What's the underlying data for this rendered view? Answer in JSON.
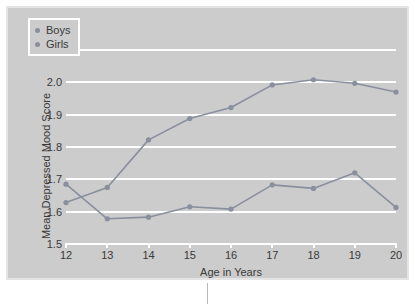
{
  "chart_data": {
    "type": "line",
    "title": "",
    "xlabel": "Age in Years",
    "ylabel": "Mean Depressed Mood Score",
    "x": [
      12,
      13,
      14,
      15,
      16,
      17,
      18,
      19,
      20
    ],
    "categories": [
      "12",
      "13",
      "14",
      "15",
      "16",
      "17",
      "18",
      "19",
      "20"
    ],
    "xtick_labels": [
      "12",
      "13",
      "14",
      "15",
      "16",
      "17",
      "18",
      "19",
      "20"
    ],
    "ytick_labels": [
      "1.5",
      "1.6",
      "1.7",
      "1.8",
      "1.9",
      "2.0",
      "2.1"
    ],
    "yticks": [
      1.5,
      1.6,
      1.7,
      1.8,
      1.9,
      2.0,
      2.1
    ],
    "ylim": [
      1.5,
      2.1
    ],
    "xlim": [
      12,
      20
    ],
    "grid": true,
    "grid_axis": "y",
    "grid_color": "#ffffff",
    "legend_position": "upper left",
    "background": "#cccccc",
    "series": [
      {
        "name": "Boys",
        "color": "#8a8f9e",
        "marker": "circle",
        "values": [
          1.685,
          1.578,
          1.583,
          1.615,
          1.608,
          1.683,
          1.672,
          1.72,
          1.613
        ]
      },
      {
        "name": "Girls",
        "color": "#8a8f9e",
        "marker": "circle",
        "values": [
          1.628,
          1.675,
          1.822,
          1.888,
          1.922,
          1.992,
          2.008,
          1.997,
          1.97
        ]
      }
    ]
  },
  "legend": {
    "items": [
      {
        "label": "Boys",
        "color": "#8a8f9e"
      },
      {
        "label": "Girls",
        "color": "#8a8f9e"
      }
    ]
  }
}
